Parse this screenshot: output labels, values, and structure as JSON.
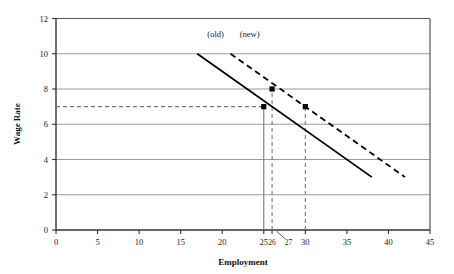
{
  "chart_data": {
    "type": "line",
    "title": "",
    "xlabel": "Employment",
    "ylabel": "Wage Rate",
    "xlim": [
      0,
      45
    ],
    "ylim": [
      0,
      12
    ],
    "xticks": [
      0,
      5,
      10,
      15,
      20,
      25,
      30,
      35,
      40,
      45
    ],
    "xtick_labels": [
      "0",
      "5",
      "10",
      "15",
      "20",
      "25",
      "30",
      "35",
      "40",
      "45"
    ],
    "yticks": [
      0,
      2,
      4,
      6,
      8,
      10,
      12
    ],
    "ytick_labels": [
      "0",
      "2",
      "4",
      "6",
      "8",
      "10",
      "12"
    ],
    "extra_xticks": [
      {
        "value": 26,
        "label": "26"
      },
      {
        "value": 27,
        "label": "27",
        "leader": true
      }
    ],
    "grid": {
      "horizontal": true,
      "vertical": false,
      "color": "#9a9a9a"
    },
    "legend": {
      "position": "inline-above-curves"
    },
    "series": [
      {
        "name": "(old)",
        "style": "solid",
        "color": "#000000",
        "label": "(old)",
        "label_at": {
          "x": 19.2,
          "y": 10.95
        },
        "x": [
          17,
          38
        ],
        "y": [
          10,
          3
        ],
        "points": [
          {
            "x": 25,
            "y": 7,
            "marker": "square"
          }
        ]
      },
      {
        "name": "(new)",
        "style": "dashed",
        "color": "#000000",
        "label": "(new)",
        "label_at": {
          "x": 23.3,
          "y": 10.95
        },
        "x": [
          21,
          42
        ],
        "y": [
          10,
          3
        ],
        "points": [
          {
            "x": 26,
            "y": 8,
            "marker": "square"
          },
          {
            "x": 30,
            "y": 7,
            "marker": "square"
          }
        ]
      }
    ],
    "reference_lines": [
      {
        "name": "wage-7-horizontal",
        "orientation": "horizontal",
        "value": 7,
        "from": 0,
        "to": 25,
        "style": "dashed",
        "color": "#777777"
      },
      {
        "name": "employment-25-vertical",
        "orientation": "vertical",
        "value": 25,
        "from": 0,
        "to": 7,
        "style": "solid",
        "color": "#777777"
      },
      {
        "name": "employment-26-vertical",
        "orientation": "vertical",
        "value": 26,
        "from": 0,
        "to": 8,
        "style": "dashed",
        "color": "#777777"
      },
      {
        "name": "employment-30-vertical",
        "orientation": "vertical",
        "value": 30,
        "from": 0,
        "to": 7,
        "style": "dashed",
        "color": "#777777"
      }
    ],
    "annotations": [
      {
        "text": "(old)",
        "x": 19.2,
        "y": 10.95
      },
      {
        "text": "(new)",
        "x": 23.3,
        "y": 10.95
      }
    ]
  }
}
